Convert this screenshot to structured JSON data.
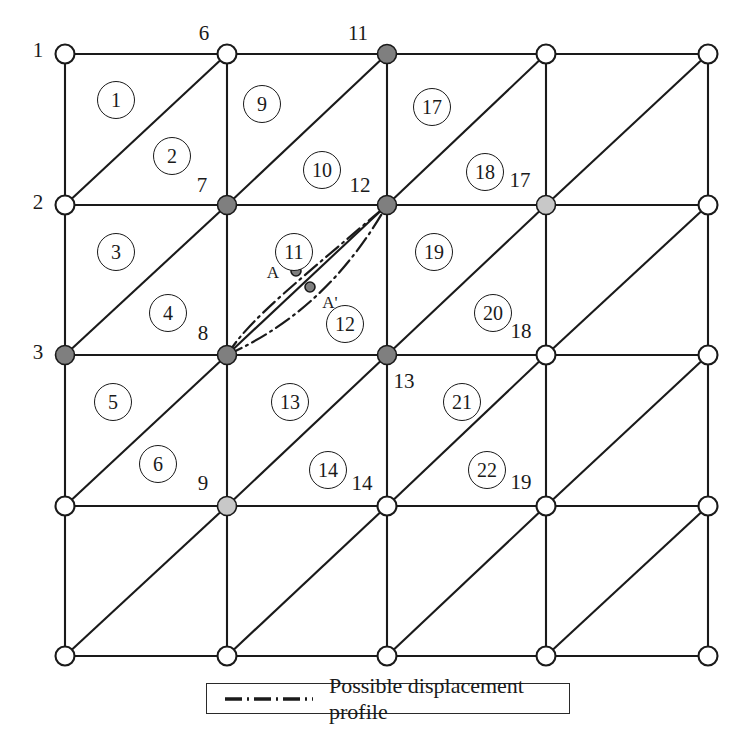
{
  "figure": {
    "type": "finite-element-mesh-diagram",
    "grid": {
      "columns": 4,
      "rows": 4,
      "node_columns": 5,
      "node_rows": 5,
      "x_positions": [
        65,
        227,
        387,
        546,
        708
      ],
      "y_positions": [
        54,
        205,
        355,
        506,
        656
      ],
      "diagonal_direction": "bottom-left-to-top-right"
    }
  },
  "colors": {
    "line": "#1a1a1a",
    "node_open_fill": "#ffffff",
    "node_dark_fill": "#7f7f7f",
    "node_light_fill": "#c8c8c8",
    "text": "#1a1a1a",
    "background": "#ffffff"
  },
  "nodes": [
    {
      "id": "n-r0c0",
      "x": 65,
      "y": 54,
      "fill": "open",
      "label": "1",
      "label_x": 38,
      "label_y": 50
    },
    {
      "id": "n-r0c1",
      "x": 227,
      "y": 54,
      "fill": "open",
      "label": "6",
      "label_x": 204,
      "label_y": 33
    },
    {
      "id": "n-r0c2",
      "x": 387,
      "y": 54,
      "fill": "dark",
      "label": "11",
      "label_x": 358,
      "label_y": 33
    },
    {
      "id": "n-r0c3",
      "x": 546,
      "y": 54,
      "fill": "open",
      "label": "",
      "label_x": 0,
      "label_y": 0
    },
    {
      "id": "n-r0c4",
      "x": 708,
      "y": 54,
      "fill": "open",
      "label": "",
      "label_x": 0,
      "label_y": 0
    },
    {
      "id": "n-r1c0",
      "x": 65,
      "y": 205,
      "fill": "open",
      "label": "2",
      "label_x": 38,
      "label_y": 202
    },
    {
      "id": "n-r1c1",
      "x": 227,
      "y": 205,
      "fill": "dark",
      "label": "7",
      "label_x": 202,
      "label_y": 185
    },
    {
      "id": "n-r1c2",
      "x": 387,
      "y": 205,
      "fill": "dark",
      "label": "12",
      "label_x": 360,
      "label_y": 185
    },
    {
      "id": "n-r1c3",
      "x": 546,
      "y": 205,
      "fill": "light",
      "label": "17",
      "label_x": 520,
      "label_y": 180
    },
    {
      "id": "n-r1c4",
      "x": 708,
      "y": 205,
      "fill": "open",
      "label": "",
      "label_x": 0,
      "label_y": 0
    },
    {
      "id": "n-r2c0",
      "x": 65,
      "y": 355,
      "fill": "dark",
      "label": "3",
      "label_x": 38,
      "label_y": 352
    },
    {
      "id": "n-r2c1",
      "x": 227,
      "y": 355,
      "fill": "dark",
      "label": "8",
      "label_x": 203,
      "label_y": 333
    },
    {
      "id": "n-r2c2",
      "x": 387,
      "y": 355,
      "fill": "dark",
      "label": "13",
      "label_x": 404,
      "label_y": 381
    },
    {
      "id": "n-r2c3",
      "x": 546,
      "y": 355,
      "fill": "open",
      "label": "18",
      "label_x": 521,
      "label_y": 331
    },
    {
      "id": "n-r2c4",
      "x": 708,
      "y": 355,
      "fill": "open",
      "label": "",
      "label_x": 0,
      "label_y": 0
    },
    {
      "id": "n-r3c0",
      "x": 65,
      "y": 506,
      "fill": "open",
      "label": "",
      "label_x": 0,
      "label_y": 0
    },
    {
      "id": "n-r3c1",
      "x": 227,
      "y": 506,
      "fill": "light",
      "label": "9",
      "label_x": 203,
      "label_y": 483
    },
    {
      "id": "n-r3c2",
      "x": 387,
      "y": 506,
      "fill": "open",
      "label": "14",
      "label_x": 362,
      "label_y": 483
    },
    {
      "id": "n-r3c3",
      "x": 546,
      "y": 506,
      "fill": "open",
      "label": "19",
      "label_x": 521,
      "label_y": 482
    },
    {
      "id": "n-r3c4",
      "x": 708,
      "y": 506,
      "fill": "open",
      "label": "",
      "label_x": 0,
      "label_y": 0
    },
    {
      "id": "n-r4c0",
      "x": 65,
      "y": 656,
      "fill": "open",
      "label": "",
      "label_x": 0,
      "label_y": 0
    },
    {
      "id": "n-r4c1",
      "x": 227,
      "y": 656,
      "fill": "open",
      "label": "",
      "label_x": 0,
      "label_y": 0
    },
    {
      "id": "n-r4c2",
      "x": 387,
      "y": 656,
      "fill": "open",
      "label": "",
      "label_x": 0,
      "label_y": 0
    },
    {
      "id": "n-r4c3",
      "x": 546,
      "y": 656,
      "fill": "open",
      "label": "",
      "label_x": 0,
      "label_y": 0
    },
    {
      "id": "n-r4c4",
      "x": 708,
      "y": 656,
      "fill": "open",
      "label": "",
      "label_x": 0,
      "label_y": 0
    }
  ],
  "elements": [
    {
      "number": "1",
      "x": 116,
      "y": 100
    },
    {
      "number": "2",
      "x": 172,
      "y": 156
    },
    {
      "number": "3",
      "x": 116,
      "y": 252
    },
    {
      "number": "4",
      "x": 168,
      "y": 313
    },
    {
      "number": "5",
      "x": 113,
      "y": 402
    },
    {
      "number": "6",
      "x": 158,
      "y": 464
    },
    {
      "number": "9",
      "x": 262,
      "y": 104
    },
    {
      "number": "10",
      "x": 322,
      "y": 170
    },
    {
      "number": "11",
      "x": 294,
      "y": 252
    },
    {
      "number": "12",
      "x": 345,
      "y": 324
    },
    {
      "number": "13",
      "x": 290,
      "y": 402
    },
    {
      "number": "14",
      "x": 328,
      "y": 470
    },
    {
      "number": "17",
      "x": 432,
      "y": 107
    },
    {
      "number": "18",
      "x": 485,
      "y": 172
    },
    {
      "number": "19",
      "x": 434,
      "y": 252
    },
    {
      "number": "20",
      "x": 493,
      "y": 313
    },
    {
      "number": "21",
      "x": 462,
      "y": 402
    },
    {
      "number": "22",
      "x": 487,
      "y": 470
    }
  ],
  "displacement_profile": {
    "start_node": "n-r2c1",
    "end_node": "n-r1c2",
    "points": [
      {
        "id": "point-a",
        "label": "A",
        "x": 296,
        "y": 271,
        "label_x": 273,
        "label_y": 273
      },
      {
        "id": "point-a-prime",
        "label": "A'",
        "x": 310,
        "y": 287,
        "label_x": 330,
        "label_y": 303
      }
    ],
    "curves": [
      {
        "id": "curve-upper",
        "d": "M 227 355 C 250 318, 300 280, 387 205"
      },
      {
        "id": "curve-lower",
        "d": "M 227 355 C 300 322, 350 270, 387 205"
      }
    ],
    "line_style": "dash-dot"
  },
  "legend": {
    "label": "Possible displacement profile",
    "sample_style": "dash-dot",
    "box": {
      "x": 206,
      "y": 683,
      "width": 364,
      "height": 31
    }
  }
}
